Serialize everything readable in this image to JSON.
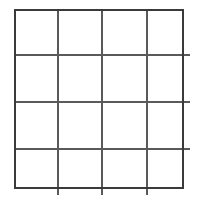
{
  "canvas": {
    "width": 197,
    "height": 201,
    "background_color": "#ffffff"
  },
  "grid": {
    "name": "empty-4x4-grid",
    "columns": 4,
    "rows": 4,
    "cell_count": 16,
    "left": 14,
    "top": 9,
    "width": 170,
    "height": 180,
    "cell_width": 42.5,
    "cell_height": 45,
    "outer_border_color": "#3a3a3a",
    "outer_border_width": 2,
    "inner_line_color": "#5a5a5a",
    "inner_line_width": 2,
    "cell_fill_color": "#ffffff",
    "vertical_line_positions": [
      14,
      56,
      99,
      141,
      184
    ],
    "horizontal_line_positions": [
      9,
      54,
      99,
      144,
      189
    ],
    "cells": [
      [
        " ",
        " ",
        " ",
        " "
      ],
      [
        " ",
        " ",
        " ",
        " "
      ],
      [
        " ",
        " ",
        " ",
        " "
      ],
      [
        " ",
        " ",
        " ",
        " "
      ]
    ]
  }
}
